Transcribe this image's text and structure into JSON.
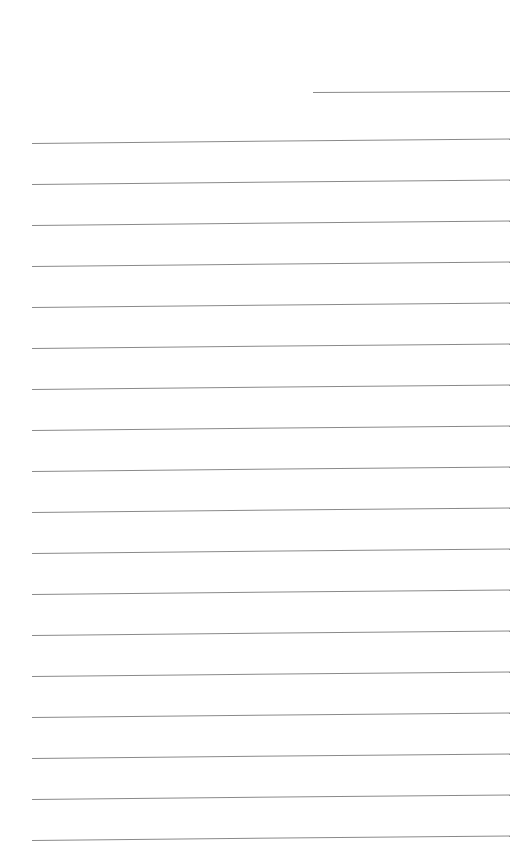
{
  "page": {
    "type": "lined-paper",
    "background": "#ffffff",
    "line_color": "#8a8a8a",
    "header_line": {
      "label": ""
    },
    "ruled_lines": 18,
    "line_spacing_px": 41
  }
}
